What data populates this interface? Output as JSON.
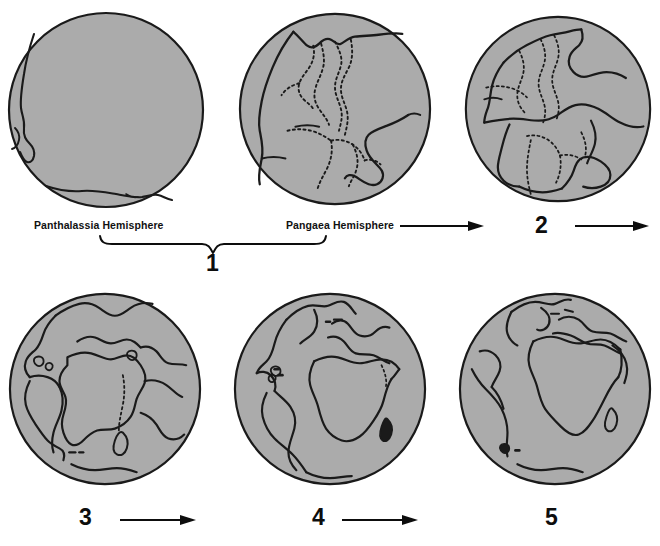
{
  "figure": {
    "type": "diagram",
    "background_color": "#ffffff",
    "land_fill_color": "#ababab",
    "outline_color": "#1a1a1a",
    "globe_count": 5
  },
  "labels": {
    "panthalassia": "Panthalassia Hemisphere",
    "pangaea": "Pangaea Hemisphere"
  },
  "stages": [
    {
      "number": "1",
      "caption": "Pangaea — single supercontinent, two hemispheres"
    },
    {
      "number": "2",
      "caption": "Initial rifting"
    },
    {
      "number": "3",
      "caption": "Atlantic opening"
    },
    {
      "number": "4",
      "caption": "Continued drift"
    },
    {
      "number": "5",
      "caption": "Present-day configuration"
    }
  ],
  "globes": [
    {
      "id": "globe-panthalassia",
      "stage": "1",
      "row": 1,
      "column": 1,
      "label": "Panthalassia Hemisphere"
    },
    {
      "id": "globe-pangaea",
      "stage": "1",
      "row": 1,
      "column": 2,
      "label": "Pangaea Hemisphere"
    },
    {
      "id": "globe-stage-2",
      "stage": "2",
      "row": 1,
      "column": 3,
      "label": "2"
    },
    {
      "id": "globe-stage-3",
      "stage": "3",
      "row": 2,
      "column": 1,
      "label": "3"
    },
    {
      "id": "globe-stage-4",
      "stage": "4",
      "row": 2,
      "column": 2,
      "label": "4"
    },
    {
      "id": "globe-stage-5",
      "stage": "5",
      "row": 2,
      "column": 3,
      "label": "5"
    }
  ],
  "arrows": [
    {
      "id": "arrow-pangaea-to-2",
      "from": "Pangaea Hemisphere",
      "to": "2",
      "direction": "right"
    },
    {
      "id": "arrow-2-to-3",
      "from": "2",
      "to": "3",
      "direction": "right"
    },
    {
      "id": "arrow-3-to-4",
      "from": "3",
      "to": "4",
      "direction": "right"
    },
    {
      "id": "arrow-4-to-5",
      "from": "4",
      "to": "5",
      "direction": "right"
    }
  ],
  "brace": {
    "id": "brace-stage-1",
    "spans": [
      "Panthalassia Hemisphere",
      "Pangaea Hemisphere"
    ],
    "label": "1"
  }
}
